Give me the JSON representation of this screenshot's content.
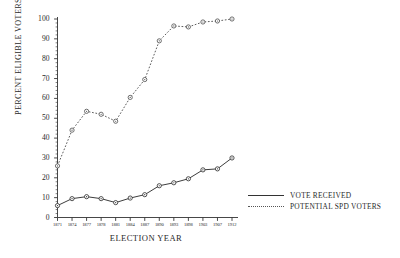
{
  "chart_data": {
    "type": "line",
    "title": "",
    "xlabel": "ELECTION YEAR",
    "ylabel": "PERCENT ELIGIBLE VOTERS",
    "categories": [
      "1871",
      "1874",
      "1877",
      "1878",
      "1881",
      "1884",
      "1887",
      "1890",
      "1893",
      "1898",
      "1903",
      "1907",
      "1912"
    ],
    "ylim": [
      0,
      100
    ],
    "yticks": [
      0,
      10,
      20,
      30,
      40,
      50,
      60,
      70,
      80,
      90,
      100
    ],
    "grid": false,
    "legend_position": "right",
    "series": [
      {
        "name": "VOTE RECEIVED",
        "style": "solid",
        "marker": "circle",
        "values": [
          6,
          9.5,
          10.5,
          9.5,
          7.5,
          9.8,
          11.5,
          16,
          17.5,
          19.5,
          24,
          24.5,
          30
        ]
      },
      {
        "name": "POTENTIAL SPD VOTERS",
        "style": "dotted",
        "marker": "circle",
        "values": [
          26,
          44,
          53.5,
          52,
          48.5,
          60.5,
          69.5,
          89,
          96.5,
          96,
          98.5,
          99,
          100
        ]
      }
    ]
  },
  "colors": {
    "axis": "#333333",
    "series_solid": "#333333",
    "series_dotted": "#555555",
    "marker_fill": "#ffffff",
    "background": "#ffffff"
  }
}
